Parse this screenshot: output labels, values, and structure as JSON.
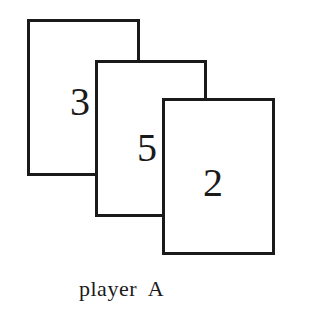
{
  "figure": {
    "cards": [
      {
        "value": "3"
      },
      {
        "value": "5"
      },
      {
        "value": "2"
      }
    ],
    "label": "player  A"
  }
}
